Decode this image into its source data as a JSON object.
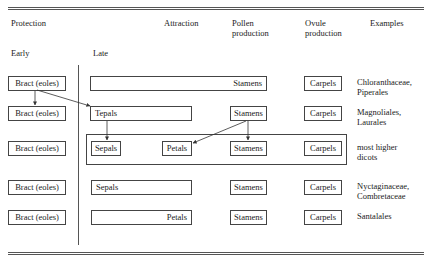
{
  "headers": {
    "protection": "Protection",
    "attraction": "Attraction",
    "pollen": [
      "Pollen",
      "production"
    ],
    "ovule": [
      "Ovule",
      "production"
    ],
    "examples": "Examples",
    "early": "Early",
    "late": "Late"
  },
  "rows": [
    {
      "bract": "Bract (eoles)",
      "late_boxes": [
        {
          "label": "",
          "align": "left"
        }
      ],
      "stamens": "Stamens",
      "stamens_inline": true,
      "carpels": "Carpels",
      "examples": [
        "Chloranthaceae,",
        "Piperales"
      ]
    },
    {
      "bract": "Bract (eoles)",
      "late_boxes": [
        {
          "label": "Tepals",
          "align": "left"
        }
      ],
      "stamens": "Stamens",
      "carpels": "Carpels",
      "examples": [
        "Magnoliales,",
        "Laurales"
      ]
    },
    {
      "bract": "Bract (eoles)",
      "late_boxes": [
        {
          "label": "Sepals"
        },
        {
          "label": "Petals"
        }
      ],
      "stamens": "Stamens",
      "carpels": "Carpels",
      "examples": [
        "most higher",
        "dicots"
      ]
    },
    {
      "bract": "Bract (eoles)",
      "late_boxes": [
        {
          "label": "Sepals",
          "align": "left"
        }
      ],
      "stamens": "Stamens",
      "carpels": "Carpels",
      "examples": [
        "Nyctaginaceae,",
        "Combretaceae"
      ]
    },
    {
      "bract": "Bract (eoles)",
      "late_boxes": [
        {
          "label": "Petals",
          "align": "right"
        }
      ],
      "stamens": "Stamens",
      "carpels": "Carpels",
      "examples": [
        "Santalales"
      ]
    }
  ]
}
